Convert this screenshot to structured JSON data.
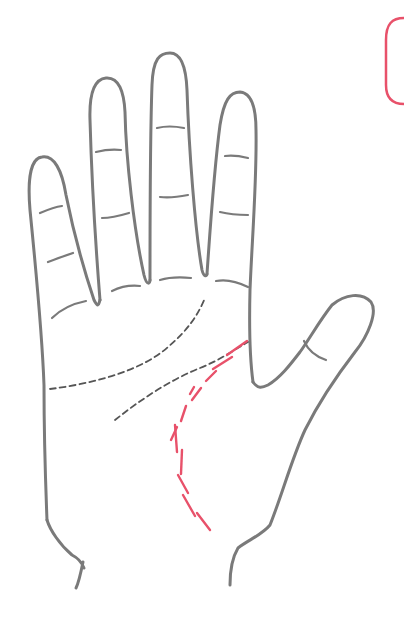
{
  "figure": {
    "colors": {
      "outline": "#7a7a7a",
      "palm_lines": "#555555",
      "highlight": "#e8516a",
      "background": "#ffffff"
    },
    "lines": [
      {
        "name": "heart-line",
        "style": "dashed",
        "color": "#555555"
      },
      {
        "name": "head-line",
        "style": "dashed",
        "color": "#555555"
      },
      {
        "name": "life-line",
        "style": "broken-dashed",
        "color": "#e8516a",
        "highlighted": true
      }
    ],
    "fingers": [
      "pinky",
      "ring",
      "middle",
      "index",
      "thumb"
    ],
    "labels": []
  }
}
